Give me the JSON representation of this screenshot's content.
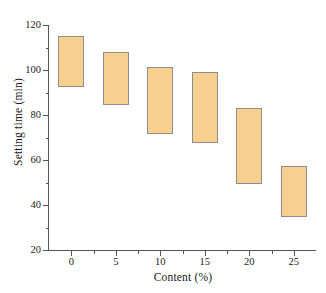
{
  "chart_data": {
    "type": "bar",
    "subtype": "floating-range-bar",
    "title": "",
    "xlabel": "Content (%)",
    "ylabel": "Setting time (min)",
    "categories": [
      "0",
      "5",
      "10",
      "15",
      "20",
      "25"
    ],
    "x": [
      0,
      5,
      10,
      15,
      20,
      25
    ],
    "series": [
      {
        "name": "Setting time range",
        "low": [
          92.5,
          84.5,
          71.5,
          67.5,
          49.5,
          34.5
        ],
        "high": [
          115.0,
          108.0,
          101.5,
          99.0,
          83.0,
          57.5
        ]
      }
    ],
    "bar_color": "#f7d08f",
    "bar_edge_color": "#8d8d8d",
    "xlim": [
      -2.5,
      27.5
    ],
    "ylim": [
      20,
      120
    ],
    "yticks": [
      20,
      40,
      60,
      80,
      100,
      120
    ],
    "ytick_labels": [
      "20",
      "40",
      "60",
      "80",
      "100",
      "120"
    ],
    "yminor_ticks": [
      30,
      50,
      70,
      90,
      110
    ],
    "xticks": [
      0,
      5,
      10,
      15,
      20,
      25
    ],
    "xtick_labels": [
      "0",
      "5",
      "10",
      "15",
      "20",
      "25"
    ],
    "xminor_ticks": [
      2.5,
      7.5,
      12.5,
      17.5,
      22.5
    ],
    "grid": false,
    "legend": false,
    "legend_position": "none",
    "axis_color": "#555555",
    "background_color": "#ffffff"
  }
}
